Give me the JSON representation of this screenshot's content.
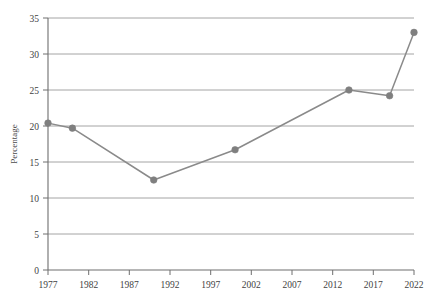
{
  "chart_data": {
    "type": "line",
    "title": "",
    "subtitle": "",
    "xlabel": "",
    "ylabel": "Percentage",
    "xlim": [
      1977,
      2022
    ],
    "ylim": [
      0,
      35
    ],
    "grid": "horizontal",
    "legend": "none",
    "x_ticks": [
      "1977",
      "1982",
      "1987",
      "1992",
      "1997",
      "2002",
      "2007",
      "2012",
      "2017",
      "2022"
    ],
    "y_ticks": [
      "0",
      "5",
      "10",
      "15",
      "20",
      "25",
      "30",
      "35"
    ],
    "series": [
      {
        "name": "Percentage",
        "color": "#8a8a8a",
        "marker": "circle",
        "x": [
          1977,
          1980,
          1990,
          2000,
          2014,
          2019,
          2022
        ],
        "values": [
          20.4,
          19.7,
          12.5,
          16.7,
          25.0,
          24.2,
          33.0
        ]
      }
    ],
    "points": [
      {
        "year": "1977",
        "value": "20.4"
      },
      {
        "year": "1980",
        "value": "19.7"
      },
      {
        "year": "1990",
        "value": "12.5"
      },
      {
        "year": "2000",
        "value": "16.7"
      },
      {
        "year": "2014",
        "value": "25.0"
      },
      {
        "year": "2019",
        "value": "24.2"
      },
      {
        "year": "2022",
        "value": "33.0"
      }
    ]
  },
  "colors": {
    "line": "#8a8a8a",
    "marker": "#7f7f7f",
    "grid": "#9a9a9a",
    "axis": "#6e6e6e",
    "text": "#3f3f3f",
    "background": "#ffffff"
  }
}
